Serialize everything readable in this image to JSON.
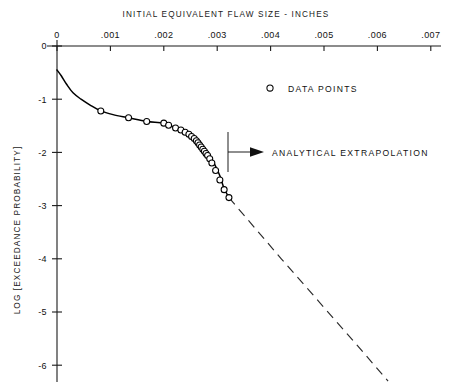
{
  "chart_data": {
    "type": "line",
    "title": "INITIAL EQUIVALENT FLAW SIZE - INCHES",
    "xlabel": "INITIAL EQUIVALENT FLAW SIZE - INCHES",
    "ylabel": "LOG [EXCEEDANCE PROBABILITY]",
    "xlim": [
      0,
      0.00722
    ],
    "ylim": [
      -6.35,
      0
    ],
    "grid": false,
    "legend_position": "upper-right-inside",
    "x_ticks": [
      0,
      0.001,
      0.002,
      0.003,
      0.004,
      0.005,
      0.006,
      0.007
    ],
    "x_tick_labels": [
      "0",
      ".001",
      ".002",
      ".003",
      ".004",
      ".005",
      ".006",
      ".007"
    ],
    "y_ticks": [
      0,
      -1,
      -2,
      -3,
      -4,
      -5,
      -6
    ],
    "y_tick_labels": [
      "0",
      "-1",
      "-2",
      "-3",
      "-4",
      "-5",
      "-6"
    ],
    "y_origin_label": "0",
    "series": [
      {
        "name": "DATA POINTS",
        "marker": "open-circle",
        "x": [
          0.00082,
          0.00134,
          0.00168,
          0.002,
          0.00209,
          0.00222,
          0.00232,
          0.0024,
          0.00247,
          0.00252,
          0.00257,
          0.00261,
          0.00264,
          0.00267,
          0.0027,
          0.00273,
          0.00276,
          0.00279,
          0.00282,
          0.00286,
          0.0029,
          0.00297,
          0.00305,
          0.00313,
          0.00322
        ],
        "y": [
          -1.22,
          -1.35,
          -1.42,
          -1.45,
          -1.49,
          -1.54,
          -1.58,
          -1.62,
          -1.66,
          -1.7,
          -1.74,
          -1.78,
          -1.82,
          -1.86,
          -1.9,
          -1.94,
          -1.98,
          -2.02,
          -2.06,
          -2.12,
          -2.2,
          -2.34,
          -2.52,
          -2.7,
          -2.85
        ]
      },
      {
        "name": "fitted curve",
        "type": "solid-line",
        "x": [
          0.0,
          8e-05,
          0.00018,
          0.0003,
          0.00045,
          0.00062,
          0.00082,
          0.00105,
          0.00134,
          0.00168,
          0.002,
          0.00222,
          0.0024,
          0.00252,
          0.00262,
          0.0027,
          0.00278,
          0.00286,
          0.00295,
          0.00305,
          0.00313,
          0.00322
        ],
        "y": [
          -0.45,
          -0.56,
          -0.72,
          -0.88,
          -1.0,
          -1.11,
          -1.22,
          -1.29,
          -1.35,
          -1.42,
          -1.45,
          -1.54,
          -1.62,
          -1.7,
          -1.8,
          -1.9,
          -2.0,
          -2.08,
          -2.22,
          -2.44,
          -2.68,
          -2.85
        ]
      },
      {
        "name": "ANALYTICAL EXTRAPOLATION",
        "type": "dashed-line",
        "x": [
          0.00322,
          0.0042,
          0.0049,
          0.0056,
          0.0062
        ],
        "y": [
          -2.85,
          -4.0,
          -4.8,
          -5.6,
          -6.3
        ]
      }
    ],
    "annotations": [
      {
        "text": "ANALYTICAL EXTRAPOLATION",
        "x": 0.00322,
        "y": -2.0,
        "arrow": "left"
      }
    ],
    "legend": [
      {
        "label": "DATA POINTS",
        "marker": "open-circle"
      }
    ]
  }
}
